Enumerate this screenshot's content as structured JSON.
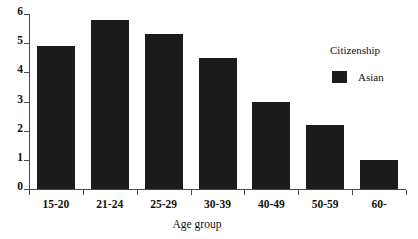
{
  "chart_data": {
    "type": "bar",
    "title": "",
    "xlabel": "Age group",
    "ylabel": "",
    "categories": [
      "15-20",
      "21-24",
      "25-29",
      "30-39",
      "40-49",
      "50-59",
      "60-"
    ],
    "values": [
      4.9,
      5.8,
      5.3,
      4.5,
      3.0,
      2.2,
      1.0
    ],
    "series": [
      {
        "name": "Asian",
        "values": [
          4.9,
          5.8,
          5.3,
          4.5,
          3.0,
          2.2,
          1.0
        ],
        "color": "#1b1b1b"
      }
    ],
    "ylim": [
      0,
      6
    ],
    "yticks": [
      0,
      1,
      2,
      3,
      4,
      5,
      6
    ],
    "ytick_labels": [
      "0",
      "1",
      "2",
      "3",
      "4",
      "5",
      "6"
    ],
    "grid": false,
    "legend_position": "right"
  },
  "legend": {
    "title": "Citizenship",
    "entries": [
      {
        "label": "Asian",
        "color": "#1b1b1b"
      }
    ]
  },
  "axes": {
    "x_title": "Age group",
    "axis_color": "#4a4a4a"
  }
}
